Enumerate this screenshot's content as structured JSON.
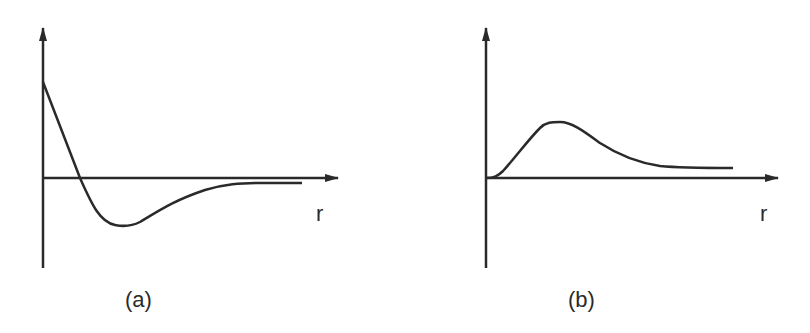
{
  "figure": {
    "panels": [
      {
        "id": "a",
        "caption": "(a)",
        "x_axis_label": "r",
        "description": "Curve starts high positive at r=0, drops steeply crossing zero, reaches a negative minimum, then rises asymptotically toward zero from below"
      },
      {
        "id": "b",
        "caption": "(b)",
        "x_axis_label": "r",
        "description": "Curve starts at zero, rises to a positive peak, then decays toward a small positive asymptote"
      }
    ],
    "colors": {
      "line": "#2a2a2a",
      "background": "#ffffff"
    }
  }
}
